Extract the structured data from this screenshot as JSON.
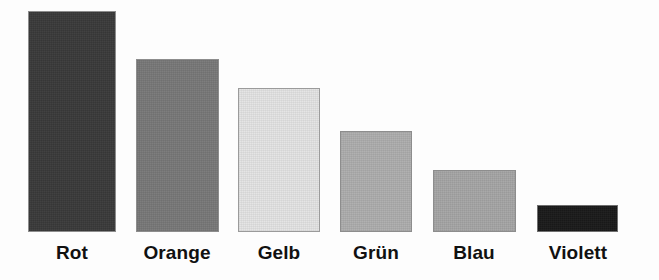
{
  "chart_data": {
    "type": "bar",
    "title": "",
    "subtitle": "",
    "xlabel": "",
    "ylabel": "",
    "grid": false,
    "legend": "none",
    "axis_visible": false,
    "orientation": "vertical",
    "categories": [
      "Rot",
      "Orange",
      "Gelb",
      "Grün",
      "Blau",
      "Violett"
    ],
    "values": [
      221,
      173,
      144,
      101,
      62,
      27
    ],
    "value_unit": "px-height",
    "ylim": [
      0,
      232
    ],
    "bars": [
      {
        "label": "Rot",
        "value": 221,
        "fill": "#3a3a3a",
        "stroke": "#8d8d8d",
        "x": 28,
        "width": 88,
        "top": 11,
        "height": 221
      },
      {
        "label": "Orange",
        "value": 173,
        "fill": "#787878",
        "stroke": "#8d8d8d",
        "x": 136,
        "width": 83,
        "top": 59,
        "height": 173
      },
      {
        "label": "Gelb",
        "value": 144,
        "fill": "#e3e3e3",
        "stroke": "#9b9b9b",
        "x": 238,
        "width": 82,
        "top": 88,
        "height": 144
      },
      {
        "label": "Grün",
        "value": 101,
        "fill": "#adadad",
        "stroke": "#8d8d8d",
        "x": 340,
        "width": 72,
        "top": 131,
        "height": 101
      },
      {
        "label": "Blau",
        "value": 62,
        "fill": "#a5a5a5",
        "stroke": "#8d8d8d",
        "x": 433,
        "width": 83,
        "top": 170,
        "height": 62
      },
      {
        "label": "Violett",
        "value": 27,
        "fill": "#1a1a1a",
        "stroke": "#6f6f6f",
        "x": 537,
        "width": 81,
        "top": 205,
        "height": 27
      }
    ],
    "labels": [
      {
        "text": "Rot",
        "center_x": 72
      },
      {
        "text": "Orange",
        "center_x": 177
      },
      {
        "text": "Gelb",
        "center_x": 279
      },
      {
        "text": "Grün",
        "center_x": 376
      },
      {
        "text": "Blau",
        "center_x": 474
      },
      {
        "text": "Violett",
        "center_x": 578
      }
    ],
    "baseline_y": 232,
    "background": "#fdfdfd"
  }
}
